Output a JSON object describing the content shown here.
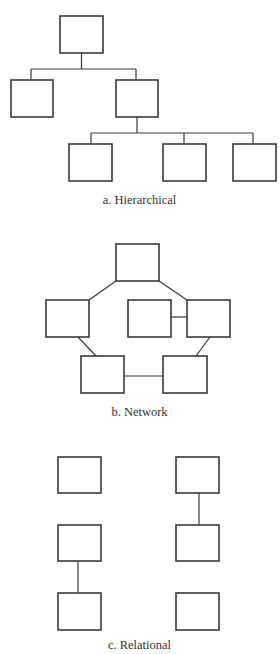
{
  "diagrams": [
    {
      "id": "hierarchical",
      "caption": "a. Hierarchical",
      "nodes": [
        {
          "x": 60,
          "y": 16,
          "w": 43,
          "h": 37
        },
        {
          "x": 11,
          "y": 80,
          "w": 42,
          "h": 37
        },
        {
          "x": 116,
          "y": 80,
          "w": 42,
          "h": 37
        },
        {
          "x": 69,
          "y": 144,
          "w": 43,
          "h": 37
        },
        {
          "x": 163,
          "y": 144,
          "w": 43,
          "h": 37
        },
        {
          "x": 233,
          "y": 144,
          "w": 43,
          "h": 37
        }
      ],
      "edges": [
        "0-1",
        "0-2",
        "2-3",
        "2-4",
        "2-5"
      ]
    },
    {
      "id": "network",
      "caption": "b. Network",
      "nodes": [
        {
          "x": 116,
          "y": 244,
          "w": 43,
          "h": 37
        },
        {
          "x": 46,
          "y": 300,
          "w": 43,
          "h": 37
        },
        {
          "x": 128,
          "y": 300,
          "w": 43,
          "h": 37
        },
        {
          "x": 187,
          "y": 300,
          "w": 43,
          "h": 37
        },
        {
          "x": 81,
          "y": 356,
          "w": 43,
          "h": 37
        },
        {
          "x": 163,
          "y": 356,
          "w": 44,
          "h": 37
        }
      ],
      "edges": [
        "0-1",
        "0-3",
        "2-3",
        "1-4",
        "3-5",
        "4-5"
      ]
    },
    {
      "id": "relational",
      "caption": "c. Relational",
      "nodes": [
        {
          "x": 58,
          "y": 457,
          "w": 43,
          "h": 36
        },
        {
          "x": 176,
          "y": 457,
          "w": 43,
          "h": 36
        },
        {
          "x": 58,
          "y": 525,
          "w": 43,
          "h": 36
        },
        {
          "x": 176,
          "y": 525,
          "w": 43,
          "h": 36
        },
        {
          "x": 58,
          "y": 593,
          "w": 43,
          "h": 37
        },
        {
          "x": 176,
          "y": 593,
          "w": 43,
          "h": 37
        }
      ],
      "edges": [
        "1-3",
        "2-4"
      ]
    }
  ]
}
